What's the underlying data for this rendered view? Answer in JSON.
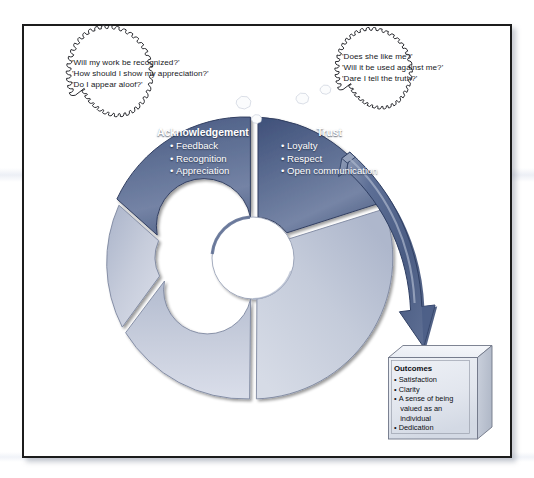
{
  "diagram": {
    "colors": {
      "segment_dark": "#5a6b8f",
      "segment_dark_edge": "#3d4d72",
      "segment_light": "#c3cadb",
      "segment_light_edge": "#9aa4bb",
      "arrow": "#5d6f96",
      "arrow_edge": "#3e4f76",
      "box_face": "#e3e7ef",
      "box_side": "#c0c7d4",
      "frame_border": "#1c1c1c",
      "label_text": "#ffffff",
      "body_text": "#16181c",
      "background": "#ffffff"
    }
  },
  "thought_bubbles": [
    {
      "id": "acknowledgement-bubble",
      "lines": [
        "'Will my work be recognized?'",
        "'How should I show my appreciation?'",
        "'Do I appear aloof?'"
      ]
    },
    {
      "id": "trust-bubble",
      "lines": [
        "'Does she like me?'",
        "'Will it be used against me?'",
        "'Dare I tell the truth?'"
      ]
    }
  ],
  "wheel": {
    "segments": [
      {
        "id": "acknowledgement",
        "title": "Acknowledgement",
        "bullets": [
          "Feedback",
          "Recognition",
          "Appreciation"
        ],
        "style": "dark",
        "labeled": true
      },
      {
        "id": "trust",
        "title": "Trust",
        "bullets": [
          "Loyalty",
          "Respect",
          "Open communication"
        ],
        "style": "dark",
        "labeled": true
      },
      {
        "id": "segment-3",
        "title": "",
        "bullets": [],
        "style": "light",
        "labeled": false
      },
      {
        "id": "segment-4",
        "title": "",
        "bullets": [],
        "style": "light",
        "labeled": false
      },
      {
        "id": "segment-5",
        "title": "",
        "bullets": [],
        "style": "light",
        "labeled": false
      }
    ]
  },
  "outcomes_box": {
    "title": "Outcomes",
    "items": [
      {
        "text": "Satisfaction",
        "continuation": []
      },
      {
        "text": "Clarity",
        "continuation": []
      },
      {
        "text": "A sense of being",
        "continuation": [
          "valued as an",
          "individual"
        ]
      },
      {
        "text": "Dedication",
        "continuation": []
      }
    ]
  },
  "arrow": {
    "id": "trust-to-outcomes-arrow",
    "from": "trust",
    "to": "outcomes_box"
  }
}
